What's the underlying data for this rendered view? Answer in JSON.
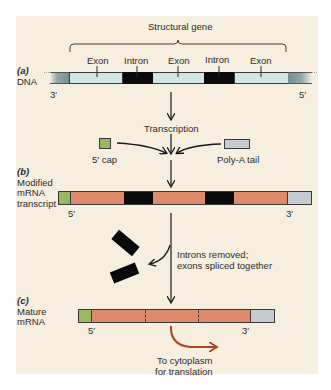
{
  "colors": {
    "background": "#f6eedf",
    "exon_dna": "#cfe6e2",
    "intron": "#0a0a0a",
    "exon_mrna": "#df8a6b",
    "cap": "#9bb660",
    "poly_a": "#c4ccd0",
    "flank": "#6f8f8f",
    "arrow": "#1a1a1a",
    "cytoplasm_arrow": "#a9441f"
  },
  "panel_a": {
    "tag": "(a)",
    "label": "DNA",
    "bracket_label": "Structural gene",
    "segments": [
      "Exon",
      "Intron",
      "Exon",
      "Intron",
      "Exon"
    ],
    "end_left": "3′",
    "end_right": "5′"
  },
  "step_transcription": "Transcription",
  "additions": {
    "cap_label": "5′ cap",
    "tail_label": "Poly-A tail"
  },
  "panel_b": {
    "tag": "(b)",
    "label_lines": [
      "Modified",
      "mRNA",
      "transcript"
    ],
    "end_left": "5′",
    "end_right": "3′"
  },
  "step_splicing": {
    "line1": "Introns removed;",
    "line2": "exons spliced together"
  },
  "panel_c": {
    "tag": "(c)",
    "label_lines": [
      "Mature",
      "mRNA"
    ],
    "end_left": "5′",
    "end_right": "3′"
  },
  "export": {
    "line1": "To cytoplasm",
    "line2": "for translation"
  }
}
